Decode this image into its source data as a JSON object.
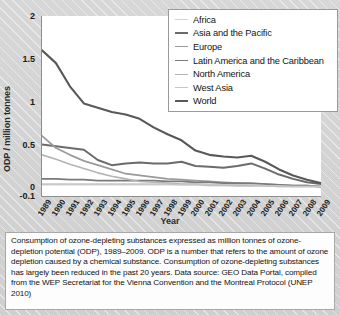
{
  "figure": {
    "caption": "Consumption of ozone-depleting substances expressed as million tonnes of ozone-depletion potential (ODP), 1989–2009. ODP is a number that refers to the amount of ozone depletion caused by a chemical substance. Consumption of ozone-depleting substances has largely been reduced in the past 20 years. Data source: GEO Data Portal, compiled from the WEP Secretariat for the Vienna Convention and the Montreal Protocol (UNEP 2010)"
  },
  "chart_data": {
    "type": "line",
    "title": "",
    "xlabel": "Year",
    "ylabel": "ODP / million tonnes",
    "xlim": [
      1989,
      2009
    ],
    "ylim": [
      -0.1,
      2
    ],
    "yticks": [
      "2",
      "1.5",
      "1",
      "0.5",
      "0",
      "-0.1"
    ],
    "ytick_values": [
      2,
      1.5,
      1,
      0.5,
      0,
      -0.1
    ],
    "grid": false,
    "legend_position": "top-right",
    "x": [
      1989,
      1990,
      1991,
      1992,
      1993,
      1994,
      1995,
      1996,
      1997,
      1998,
      1999,
      2000,
      2001,
      2002,
      2003,
      2004,
      2005,
      2006,
      2007,
      2008,
      2009
    ],
    "categories": [
      "1989",
      "1990",
      "1991",
      "1992",
      "1993",
      "1994",
      "1995",
      "1996",
      "1997",
      "1998",
      "1999",
      "2000",
      "2001",
      "2002",
      "2003",
      "2004",
      "2005",
      "2006",
      "2007",
      "2008",
      "2009"
    ],
    "series": [
      {
        "name": "Africa",
        "color": "#d2d2d2",
        "width": 1.5,
        "values": [
          0.03,
          0.03,
          0.03,
          0.03,
          0.03,
          0.03,
          0.03,
          0.03,
          0.03,
          0.03,
          0.03,
          0.03,
          0.02,
          0.02,
          0.02,
          0.02,
          0.02,
          0.01,
          0.01,
          0.01,
          0.01
        ]
      },
      {
        "name": "Asia and the Pacific",
        "color": "#6b6b6b",
        "width": 2.0,
        "values": [
          0.5,
          0.48,
          0.46,
          0.44,
          0.32,
          0.26,
          0.28,
          0.29,
          0.28,
          0.28,
          0.3,
          0.25,
          0.24,
          0.23,
          0.25,
          0.28,
          0.22,
          0.15,
          0.1,
          0.06,
          0.04
        ]
      },
      {
        "name": "Europe",
        "color": "#9a9a9a",
        "width": 1.7,
        "values": [
          0.6,
          0.46,
          0.38,
          0.31,
          0.26,
          0.21,
          0.16,
          0.14,
          0.12,
          0.1,
          0.09,
          0.08,
          0.07,
          0.06,
          0.05,
          0.04,
          0.04,
          0.03,
          0.02,
          0.02,
          0.01
        ]
      },
      {
        "name": "Latin America and the Caribbean",
        "color": "#7a7a7a",
        "width": 1.7,
        "values": [
          0.1,
          0.1,
          0.09,
          0.09,
          0.08,
          0.08,
          0.08,
          0.08,
          0.08,
          0.07,
          0.07,
          0.06,
          0.06,
          0.05,
          0.05,
          0.05,
          0.04,
          0.03,
          0.02,
          0.02,
          0.01
        ]
      },
      {
        "name": "North America",
        "color": "#b4b4b4",
        "width": 1.6,
        "values": [
          0.38,
          0.33,
          0.27,
          0.22,
          0.17,
          0.13,
          0.1,
          0.07,
          0.06,
          0.05,
          0.04,
          0.04,
          0.03,
          0.03,
          0.02,
          0.02,
          0.02,
          0.01,
          0.01,
          0.01,
          0.01
        ]
      },
      {
        "name": "West Asia",
        "color": "#c6c6c6",
        "width": 1.5,
        "values": [
          0.04,
          0.04,
          0.04,
          0.04,
          0.04,
          0.04,
          0.04,
          0.04,
          0.04,
          0.04,
          0.03,
          0.03,
          0.03,
          0.03,
          0.03,
          0.03,
          0.02,
          0.02,
          0.01,
          0.01,
          0.01
        ]
      },
      {
        "name": "World",
        "color": "#585858",
        "width": 2.1,
        "values": [
          1.6,
          1.45,
          1.18,
          0.98,
          0.93,
          0.88,
          0.85,
          0.8,
          0.7,
          0.62,
          0.55,
          0.43,
          0.38,
          0.36,
          0.35,
          0.37,
          0.3,
          0.21,
          0.14,
          0.09,
          0.05
        ]
      }
    ]
  }
}
